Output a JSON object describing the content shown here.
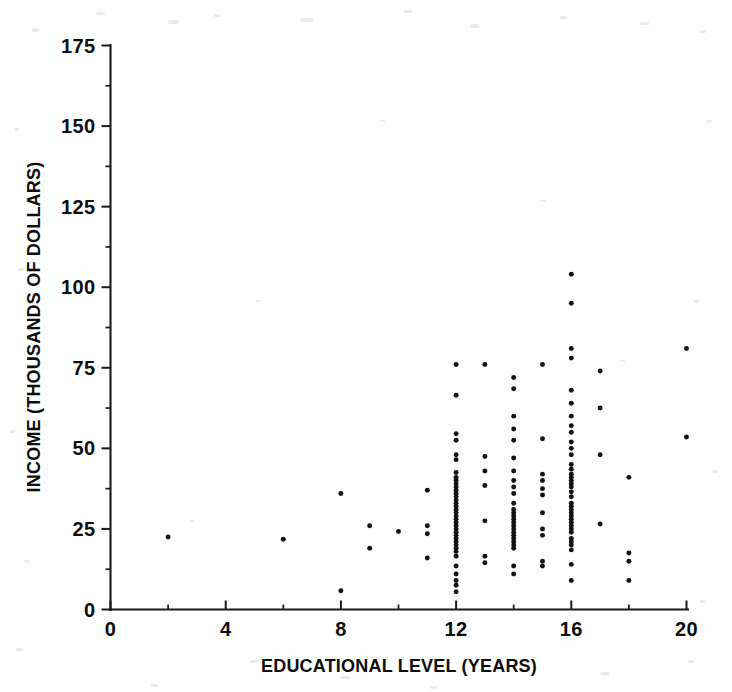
{
  "chart_data": {
    "type": "scatter",
    "title": "",
    "subtitle": "",
    "xlabel": "EDUCATIONAL LEVEL (YEARS)",
    "ylabel": "INCOME (THOUSANDS OF DOLLARS)",
    "xlim": [
      0,
      20
    ],
    "ylim": [
      0,
      175
    ],
    "xticks": [
      0,
      4,
      8,
      12,
      16,
      20
    ],
    "xticklabels": [
      "0",
      "4",
      "8",
      "12",
      "16",
      "20"
    ],
    "xminorticks": [
      2,
      6,
      10,
      14,
      18
    ],
    "yticks": [
      0,
      25,
      50,
      75,
      100,
      125,
      150,
      175
    ],
    "yticklabels": [
      "0",
      "25",
      "50",
      "75",
      "100",
      "125",
      "150",
      "175"
    ],
    "yminorticks": [
      12.5,
      37.5,
      62.5,
      87.5,
      112.5,
      137.5,
      162.5
    ],
    "grid": false,
    "legend": null,
    "marker": "circle",
    "marker_color": "#131313",
    "marker_size": 4,
    "series": [
      {
        "name": "observations",
        "points": [
          [
            2,
            22.5
          ],
          [
            6,
            21.8
          ],
          [
            8,
            36.0
          ],
          [
            8,
            5.8
          ],
          [
            9,
            26.0
          ],
          [
            9,
            19.0
          ],
          [
            10,
            24.2
          ],
          [
            11,
            37.0
          ],
          [
            11,
            26.0
          ],
          [
            11,
            23.5
          ],
          [
            11,
            16.0
          ],
          [
            12,
            76.0
          ],
          [
            12,
            66.5
          ],
          [
            12,
            54.5
          ],
          [
            12,
            52.5
          ],
          [
            12,
            48.0
          ],
          [
            12,
            46.5
          ],
          [
            12,
            42.5
          ],
          [
            12,
            41.0
          ],
          [
            12,
            40.0
          ],
          [
            12,
            39.0
          ],
          [
            12,
            38.0
          ],
          [
            12,
            37.0
          ],
          [
            12,
            36.0
          ],
          [
            12,
            35.0
          ],
          [
            12,
            34.0
          ],
          [
            12,
            33.0
          ],
          [
            12,
            32.0
          ],
          [
            12,
            31.0
          ],
          [
            12,
            30.0
          ],
          [
            12,
            29.0
          ],
          [
            12,
            28.0
          ],
          [
            12,
            27.0
          ],
          [
            12,
            26.0
          ],
          [
            12,
            25.0
          ],
          [
            12,
            24.0
          ],
          [
            12,
            23.0
          ],
          [
            12,
            22.0
          ],
          [
            12,
            21.0
          ],
          [
            12,
            20.0
          ],
          [
            12,
            19.0
          ],
          [
            12,
            18.0
          ],
          [
            12,
            16.5
          ],
          [
            12,
            13.5
          ],
          [
            12,
            11.0
          ],
          [
            12,
            9.0
          ],
          [
            12,
            7.5
          ],
          [
            12,
            5.5
          ],
          [
            13,
            76.0
          ],
          [
            13,
            47.5
          ],
          [
            13,
            43.0
          ],
          [
            13,
            38.5
          ],
          [
            13,
            27.5
          ],
          [
            13,
            16.5
          ],
          [
            13,
            14.5
          ],
          [
            14,
            72.0
          ],
          [
            14,
            68.5
          ],
          [
            14,
            60.0
          ],
          [
            14,
            56.0
          ],
          [
            14,
            52.5
          ],
          [
            14,
            47.0
          ],
          [
            14,
            43.0
          ],
          [
            14,
            40.0
          ],
          [
            14,
            38.0
          ],
          [
            14,
            36.0
          ],
          [
            14,
            33.0
          ],
          [
            14,
            31.0
          ],
          [
            14,
            30.0
          ],
          [
            14,
            29.0
          ],
          [
            14,
            28.0
          ],
          [
            14,
            27.0
          ],
          [
            14,
            26.0
          ],
          [
            14,
            25.0
          ],
          [
            14,
            24.0
          ],
          [
            14,
            23.0
          ],
          [
            14,
            22.0
          ],
          [
            14,
            21.0
          ],
          [
            14,
            20.0
          ],
          [
            14,
            19.0
          ],
          [
            14,
            13.5
          ],
          [
            14,
            11.0
          ],
          [
            15,
            76.0
          ],
          [
            15,
            53.0
          ],
          [
            15,
            42.0
          ],
          [
            15,
            40.0
          ],
          [
            15,
            37.5
          ],
          [
            15,
            35.5
          ],
          [
            15,
            30.0
          ],
          [
            15,
            25.0
          ],
          [
            15,
            23.0
          ],
          [
            15,
            15.0
          ],
          [
            15,
            13.5
          ],
          [
            16,
            104.0
          ],
          [
            16,
            95.0
          ],
          [
            16,
            81.0
          ],
          [
            16,
            78.0
          ],
          [
            16,
            68.0
          ],
          [
            16,
            64.0
          ],
          [
            16,
            60.0
          ],
          [
            16,
            57.0
          ],
          [
            16,
            55.0
          ],
          [
            16,
            52.0
          ],
          [
            16,
            50.0
          ],
          [
            16,
            48.0
          ],
          [
            16,
            45.0
          ],
          [
            16,
            43.5
          ],
          [
            16,
            42.0
          ],
          [
            16,
            41.0
          ],
          [
            16,
            40.0
          ],
          [
            16,
            39.0
          ],
          [
            16,
            38.0
          ],
          [
            16,
            36.5
          ],
          [
            16,
            35.0
          ],
          [
            16,
            33.0
          ],
          [
            16,
            32.0
          ],
          [
            16,
            31.0
          ],
          [
            16,
            30.0
          ],
          [
            16,
            29.0
          ],
          [
            16,
            28.0
          ],
          [
            16,
            27.0
          ],
          [
            16,
            26.0
          ],
          [
            16,
            25.0
          ],
          [
            16,
            24.0
          ],
          [
            16,
            22.0
          ],
          [
            16,
            21.0
          ],
          [
            16,
            20.0
          ],
          [
            16,
            18.5
          ],
          [
            16,
            14.0
          ],
          [
            16,
            9.0
          ],
          [
            17,
            74.0
          ],
          [
            17,
            62.5
          ],
          [
            17,
            48.0
          ],
          [
            17,
            26.5
          ],
          [
            18,
            41.0
          ],
          [
            18,
            17.5
          ],
          [
            18,
            15.0
          ],
          [
            18,
            9.0
          ],
          [
            20,
            81.0
          ],
          [
            20,
            53.5
          ]
        ]
      }
    ]
  },
  "axes": {
    "x_title": "EDUCATIONAL LEVEL (YEARS)",
    "y_title": "INCOME (THOUSANDS OF DOLLARS)"
  },
  "colors": {
    "ink": "#131313",
    "background": "#ffffff"
  }
}
